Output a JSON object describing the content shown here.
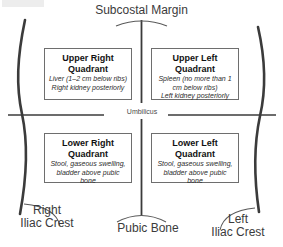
{
  "figure": {
    "kind": "abdominal-quadrants-diagram",
    "background_color": "#ffffff",
    "line_color": "#3b3b3b",
    "box_border_color": "#6e6e6e",
    "text_color": "#111111"
  },
  "anatomy_labels": {
    "subcostal_margin": "Subcostal Margin",
    "umbilicus": "Umbilicus",
    "pubic_bone": "Pubic Bone",
    "right_iliac_crest": "Right\nIliac Crest",
    "left_iliac_crest": "Left\nIliac Crest"
  },
  "quadrants": [
    {
      "id": "upper-right",
      "title": "Upper Right\nQuadrant",
      "detail": "Liver (1–2 cm below ribs)\nRight kidney posteriorly"
    },
    {
      "id": "upper-left",
      "title": "Upper Left\nQuadrant",
      "detail": "Spleen (no more than 1\ncm below ribs)\nLeft kidney posteriorly"
    },
    {
      "id": "lower-right",
      "title": "Lower Right\nQuadrant",
      "detail": "Stool, gaseous swelling,\nbladder above pubic bone"
    },
    {
      "id": "lower-left",
      "title": "Lower Left\nQuadrant",
      "detail": "Stool, gaseous swelling,\nbladder above pubic bone"
    }
  ]
}
